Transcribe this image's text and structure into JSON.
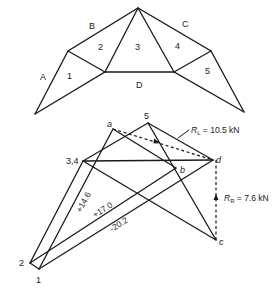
{
  "truss": {
    "space_labels": {
      "A": "A",
      "B": "B",
      "C": "C",
      "D": "D",
      "p1": "1",
      "p2": "2",
      "p3": "3",
      "p4": "4",
      "p5": "5"
    }
  },
  "force_diagram": {
    "points": {
      "a": "a",
      "b": "b",
      "c": "c",
      "d": "d",
      "p5": "5",
      "p34": "3,4",
      "p2": "2",
      "p1": "1"
    },
    "reactions": {
      "left": {
        "symbol": "R",
        "sub": "L",
        "value": " = 10.5 kN"
      },
      "right": {
        "symbol": "R",
        "sub": "R",
        "value": " = 7.6 kN"
      }
    },
    "member_forces": {
      "f1": "+14.6",
      "f2": "+17.0",
      "f3": "-20.2"
    }
  }
}
